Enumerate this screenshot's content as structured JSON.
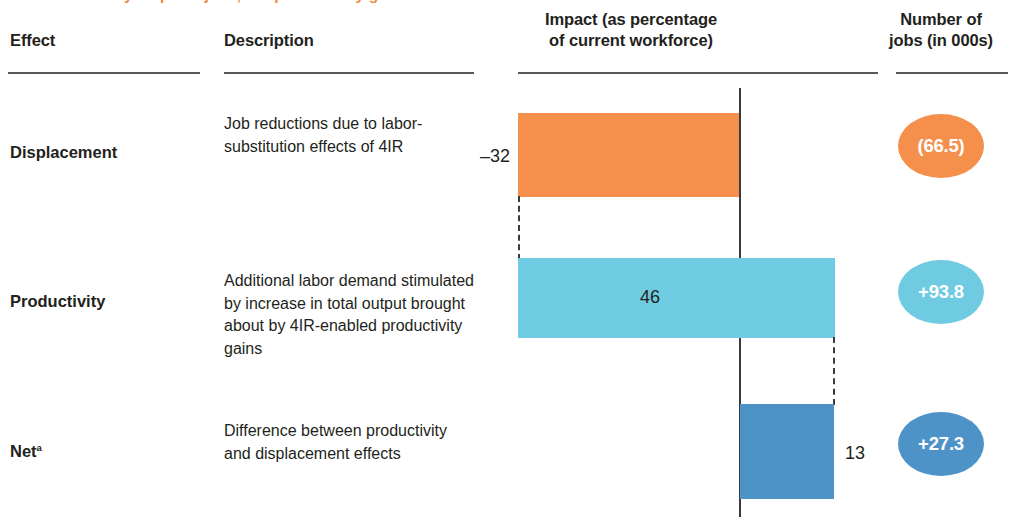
{
  "exhibit": {
    "clipped_title": "Automation may displace jobs, but productivity gains create new demand.",
    "footnote_marker": "a"
  },
  "headers": {
    "effect": "Effect",
    "description": "Description",
    "impact_line1": "Impact (as percentage",
    "impact_line2": "of current workforce)",
    "number_line1": "Number of",
    "number_line2": "jobs (in 000s)"
  },
  "rows": [
    {
      "effect": "Displacement",
      "has_superscript": false,
      "description": "Job reductions due to labor-substitution effects of 4IR",
      "impact_label": "–32",
      "impact_value": -32,
      "jobs_label": "(66.5)",
      "jobs_value": -66.5,
      "color": "#f4904c",
      "label_position": "outside-left"
    },
    {
      "effect": "Productivity",
      "has_superscript": false,
      "description": "Additional labor demand stimulated by increase in total output brought about by 4IR-enabled productivity gains",
      "impact_label": "46",
      "impact_value": 46,
      "jobs_label": "+93.8",
      "jobs_value": 93.8,
      "color": "#6ecbe2",
      "label_position": "inside"
    },
    {
      "effect": "Net",
      "has_superscript": true,
      "description": "Difference between productivity and displacement effects",
      "impact_label": "13",
      "impact_value": 13,
      "jobs_label": "+27.3",
      "jobs_value": 27.3,
      "color": "#4e93c8",
      "label_position": "outside-right"
    }
  ],
  "chart_data": {
    "type": "bar",
    "subtype": "waterfall",
    "categories": [
      "Displacement",
      "Productivity",
      "Net"
    ],
    "series": [
      {
        "name": "Impact (as percentage of current workforce)",
        "values": [
          -32,
          46,
          13
        ],
        "unit": "percent"
      },
      {
        "name": "Number of jobs (in 000s)",
        "values": [
          -66.5,
          93.8,
          27.3
        ],
        "unit": "thousands of jobs"
      }
    ],
    "colors": [
      "#f4904c",
      "#6ecbe2",
      "#4e93c8"
    ],
    "xlabel": "",
    "ylabel": "",
    "baseline": 0,
    "grid": false,
    "legend": "none",
    "orientation": "horizontal",
    "annotations": [
      "–32",
      "46",
      "13",
      "(66.5)",
      "+93.8",
      "+27.3"
    ]
  }
}
